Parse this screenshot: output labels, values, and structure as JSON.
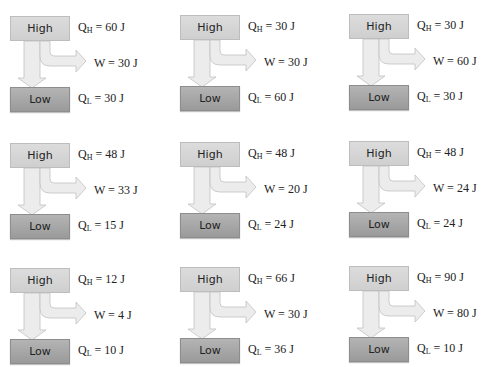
{
  "labels": {
    "high": "High",
    "low": "Low",
    "qh_sym": "Q",
    "qh_sub": "H",
    "ql_sym": "Q",
    "ql_sub": "L",
    "w_sym": "W"
  },
  "panels": [
    {
      "qh": "= 60 J",
      "w": "= 30 J",
      "ql": "= 30 J"
    },
    {
      "qh": "= 30 J",
      "w": "= 30 J",
      "ql": "= 60 J"
    },
    {
      "qh": "= 30 J",
      "w": "= 60 J",
      "ql": "= 30 J"
    },
    {
      "qh": "= 48 J",
      "w": "= 33 J",
      "ql": "= 15 J"
    },
    {
      "qh": "= 48 J",
      "w": "= 20 J",
      "ql": "= 24 J"
    },
    {
      "qh": "= 48 J",
      "w": "= 24 J",
      "ql": "= 24 J"
    },
    {
      "qh": "= 12 J",
      "w": "= 4 J",
      "ql": "= 10 J"
    },
    {
      "qh": "= 66 J",
      "w": "= 30 J",
      "ql": "= 36 J"
    },
    {
      "qh": "= 90 J",
      "w": "= 80 J",
      "ql": "= 10 J"
    }
  ],
  "colors": {
    "high_box": "#d4d4d4",
    "low_box": "#a6a6a6",
    "arrow_fill": "#ececec",
    "arrow_stroke": "#c2c2c2"
  }
}
